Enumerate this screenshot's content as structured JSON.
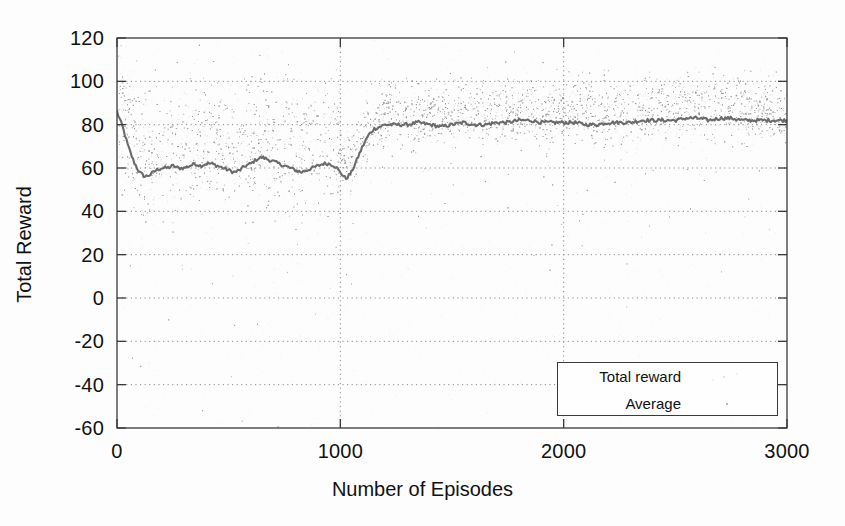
{
  "chart_data": {
    "type": "scatter",
    "title": "",
    "xlabel": "Number of Episodes",
    "ylabel": "Total Reward",
    "xlim": [
      0,
      3000
    ],
    "ylim": [
      -60,
      120
    ],
    "xticks": [
      "0",
      "1000",
      "2000",
      "3000"
    ],
    "xtick_values": [
      0,
      1000,
      2000,
      3000
    ],
    "yticks": [
      "120",
      "100",
      "80",
      "60",
      "40",
      "20",
      "0",
      "-20",
      "-40",
      "-60"
    ],
    "ytick_values": [
      120,
      100,
      80,
      60,
      40,
      20,
      0,
      -20,
      -40,
      -60
    ],
    "grid": true,
    "legend_position": "lower right",
    "series": [
      {
        "name": "Total reward",
        "style": "scatter",
        "color": "#9a9a9a",
        "description": "Per-episode total reward samples; dense noisy cloud centred on the running average, scattered outliers spread down toward -60.",
        "noise_bands": [
          {
            "x_start": 0,
            "x_end": 1000,
            "center": 72,
            "spread": 26
          },
          {
            "x_start": 1000,
            "x_end": 3000,
            "center": 87,
            "spread": 12
          }
        ]
      },
      {
        "name": "Average",
        "style": "line",
        "color": "#6b6b6b",
        "x": [
          0,
          25,
          50,
          75,
          100,
          125,
          150,
          175,
          200,
          225,
          250,
          275,
          300,
          325,
          350,
          375,
          400,
          425,
          450,
          475,
          500,
          525,
          550,
          575,
          600,
          625,
          650,
          675,
          700,
          725,
          750,
          775,
          800,
          825,
          850,
          875,
          900,
          925,
          950,
          975,
          1000,
          1025,
          1050,
          1075,
          1100,
          1125,
          1150,
          1175,
          1200,
          1250,
          1300,
          1350,
          1400,
          1450,
          1500,
          1550,
          1600,
          1650,
          1700,
          1750,
          1800,
          1850,
          1900,
          1950,
          2000,
          2050,
          2100,
          2150,
          2200,
          2250,
          2300,
          2350,
          2400,
          2450,
          2500,
          2550,
          2600,
          2650,
          2700,
          2750,
          2800,
          2850,
          2900,
          2950,
          3000
        ],
        "y": [
          86,
          79,
          70,
          63,
          58,
          56,
          57,
          59,
          60,
          60,
          61,
          60,
          60,
          61,
          62,
          61,
          62,
          62,
          61,
          60,
          59,
          58,
          59,
          61,
          62,
          64,
          65,
          64,
          63,
          62,
          61,
          60,
          59,
          58,
          59,
          60,
          61,
          62,
          62,
          61,
          58,
          55,
          58,
          64,
          70,
          75,
          78,
          79,
          80,
          80,
          80,
          81,
          80,
          79,
          80,
          81,
          80,
          80,
          81,
          81,
          82,
          82,
          81,
          81,
          81,
          81,
          80,
          80,
          81,
          81,
          81,
          82,
          82,
          82,
          82,
          83,
          83,
          82,
          83,
          83,
          82,
          82,
          82,
          82,
          82
        ]
      }
    ]
  },
  "legend": {
    "entries": [
      {
        "label": "Total reward",
        "marker": "scatter-dots"
      },
      {
        "label": "Average",
        "marker": "solid-line"
      }
    ]
  },
  "axes": {
    "x_label": "Number of Episodes",
    "y_label": "Total Reward"
  }
}
